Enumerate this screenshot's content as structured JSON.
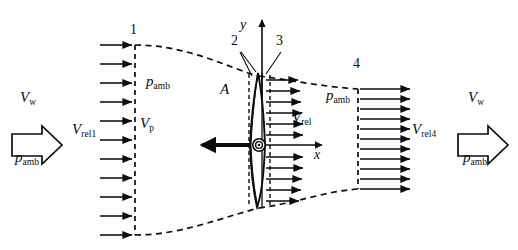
{
  "figure": {
    "type": "actuator-disk-stream-tube-diagram",
    "background_color": "#ffffff",
    "line_color": "#0d0d0d",
    "width": 518,
    "height": 250
  },
  "stations": [
    {
      "id": "station-1",
      "label": "1",
      "x": 135,
      "y": 32
    },
    {
      "id": "station-2",
      "label": "2",
      "x": 234,
      "y": 40
    },
    {
      "id": "station-3",
      "label": "3",
      "x": 277,
      "y": 40
    },
    {
      "id": "station-4",
      "label": "4",
      "x": 354,
      "y": 62
    }
  ],
  "axes": {
    "y_label": "y",
    "x_label": "x",
    "origin_x": 262,
    "origin_y": 145
  },
  "labels": {
    "wind_speed_far_upstream": {
      "base": "V",
      "sub": "w"
    },
    "relative_velocity_1": {
      "base": "V",
      "sub": "rel1"
    },
    "velocity_at_plane": {
      "base": "V",
      "sub": "p"
    },
    "relative_velocity_disk": {
      "base": "V",
      "sub": "rel"
    },
    "relative_velocity_4": {
      "base": "V",
      "sub": "rel4"
    },
    "wind_speed_far_downstream": {
      "base": "V",
      "sub": "w"
    },
    "ambient_pressure": {
      "base": "p",
      "sub": "amb"
    },
    "rotor_area": {
      "base": "A",
      "sub": ""
    }
  },
  "annotations": [
    {
      "name": "p-amb-upstream",
      "base": "p",
      "sub": "amb",
      "x": 148,
      "y": 82
    },
    {
      "name": "p-amb-downstream",
      "base": "p",
      "sub": "amb",
      "x": 329,
      "y": 96
    },
    {
      "name": "p-amb-far-left",
      "base": "p",
      "sub": "amb",
      "x": 17,
      "y": 158
    },
    {
      "name": "p-amb-far-right",
      "base": "p",
      "sub": "amb",
      "x": 465,
      "y": 158
    },
    {
      "name": "v-w-left",
      "base": "V",
      "sub": "w",
      "x": 22,
      "y": 98
    },
    {
      "name": "v-w-right",
      "base": "V",
      "sub": "w",
      "x": 470,
      "y": 98
    },
    {
      "name": "v-rel1",
      "base": "V",
      "sub": "rel1",
      "x": 74,
      "y": 130
    },
    {
      "name": "v-p",
      "base": "V",
      "sub": "p",
      "x": 141,
      "y": 124
    },
    {
      "name": "v-rel",
      "base": "V",
      "sub": "rel",
      "x": 294,
      "y": 117
    },
    {
      "name": "v-rel4",
      "base": "V",
      "sub": "rel4",
      "x": 413,
      "y": 130
    },
    {
      "name": "rotor-area",
      "base": "A",
      "sub": "",
      "x": 222,
      "y": 89
    }
  ],
  "flow_arrows": {
    "upstream_row_count": 11,
    "disk_row_count": 13,
    "downstream_row_count": 11
  },
  "bulk_arrows": [
    {
      "name": "freestream-arrow-left",
      "direction": "right",
      "x": 18,
      "y": 123
    },
    {
      "name": "freestream-arrow-right",
      "direction": "right",
      "x": 458,
      "y": 123
    }
  ],
  "thrust_arrow": {
    "name": "thrust-arrow",
    "direction": "left",
    "from_x": 259,
    "to_x": 196,
    "y": 145
  },
  "rotor": {
    "name": "rotor-disk",
    "center_x": 259,
    "center_y": 145,
    "top_y": 73,
    "bottom_y": 207,
    "hub_radius": 6
  }
}
